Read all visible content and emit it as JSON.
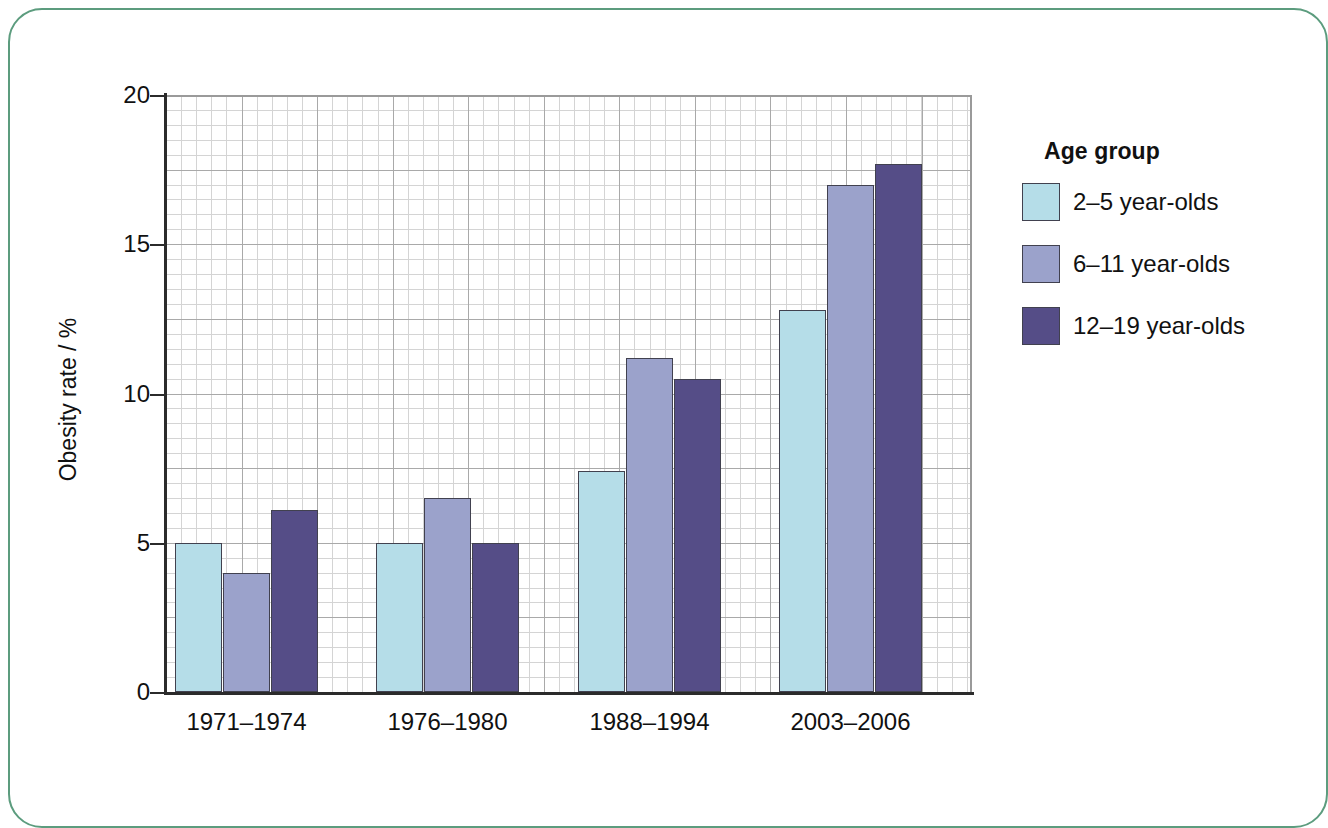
{
  "frame": {
    "border_color": "#5c9c7e"
  },
  "chart_data": {
    "type": "bar",
    "title": "",
    "xlabel": "",
    "ylabel": "Obesity rate / %",
    "categories": [
      "1971–1974",
      "1976–1980",
      "1988–1994",
      "2003–2006"
    ],
    "series": [
      {
        "name": "2–5 year-olds",
        "color": "#b5dde8",
        "values": [
          5.0,
          5.0,
          7.4,
          12.8
        ]
      },
      {
        "name": "6–11 year-olds",
        "color": "#9ba2cb",
        "values": [
          4.0,
          6.5,
          11.2,
          17.0
        ]
      },
      {
        "name": "12–19 year-olds",
        "color": "#554d87",
        "values": [
          6.1,
          5.0,
          10.5,
          17.7
        ]
      }
    ],
    "ylim": [
      0,
      20
    ],
    "yticks": [
      0,
      5,
      10,
      15,
      20
    ],
    "ytick_labels": [
      "0",
      "5",
      "10",
      "15",
      "20"
    ],
    "y_minor_step": 0.5,
    "y_major_gridline_step": 2.5,
    "grid": true,
    "legend": {
      "title": "Age group",
      "position": "right",
      "entries": [
        "2–5 year-olds",
        "6–11 year-olds",
        "12–19 year-olds"
      ]
    }
  }
}
